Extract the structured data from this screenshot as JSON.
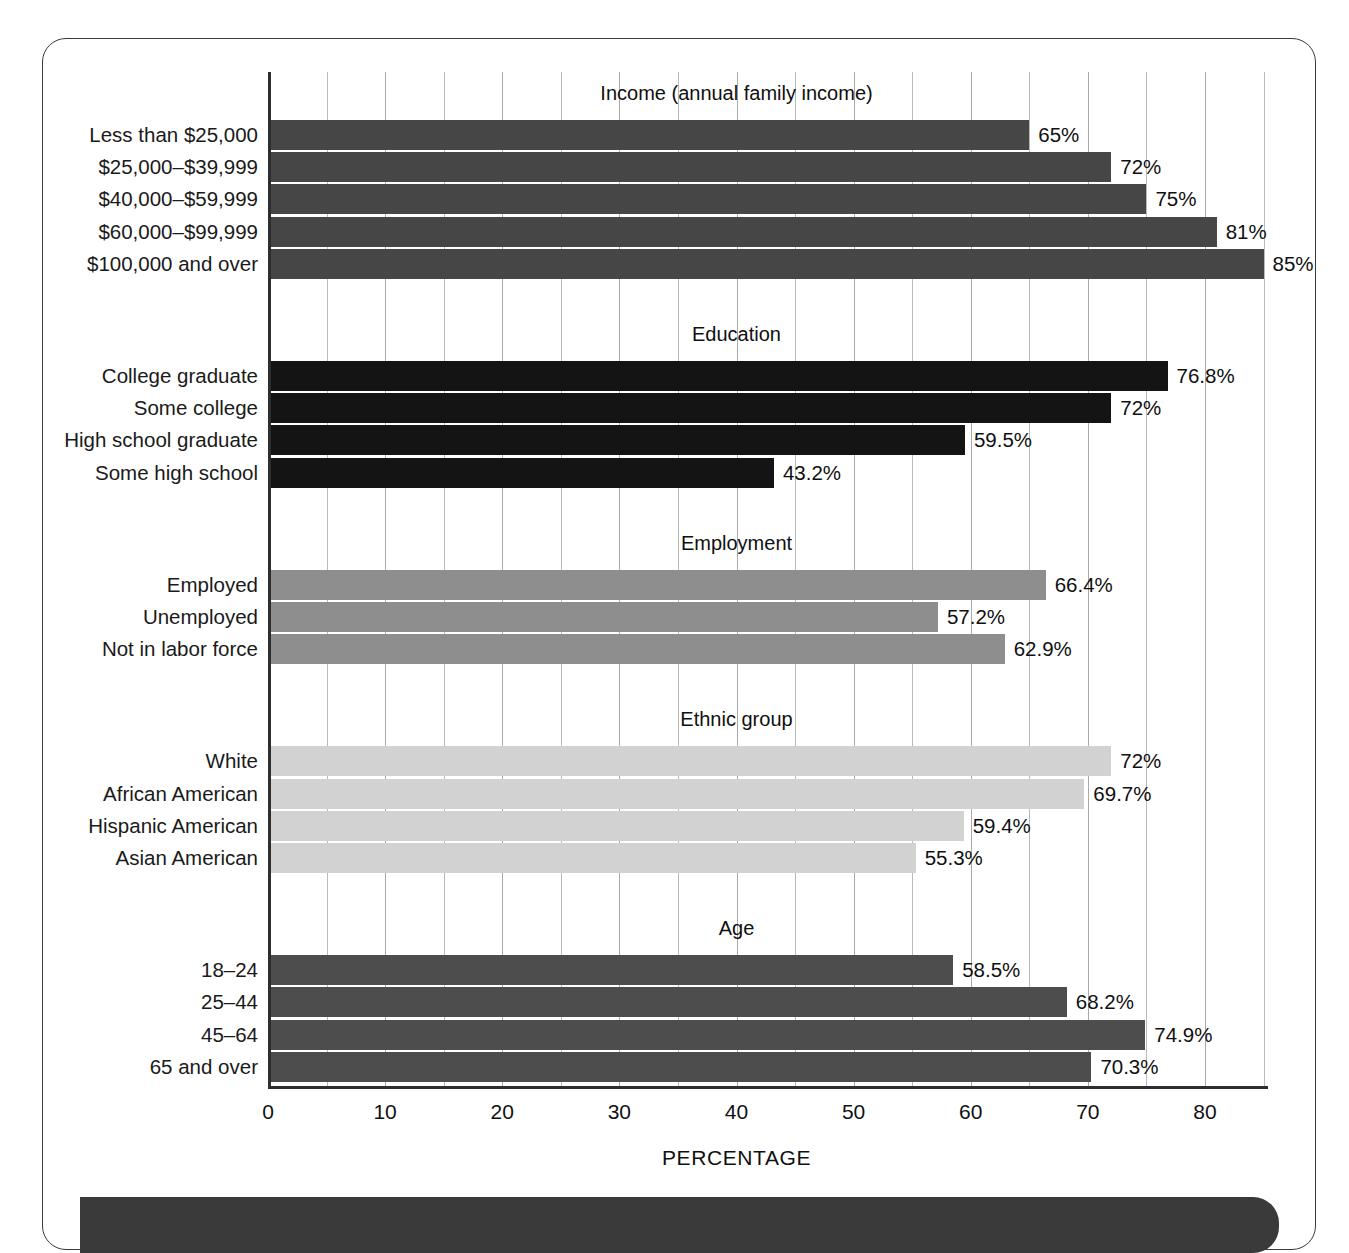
{
  "chart_data": {
    "type": "bar",
    "orientation": "horizontal",
    "title": "",
    "xlabel": "PERCENTAGE",
    "ylabel": "",
    "xlim": [
      0,
      86
    ],
    "xticks": [
      0,
      10,
      20,
      30,
      40,
      50,
      60,
      70,
      80
    ],
    "xtick_labels": [
      "0",
      "10",
      "20",
      "30",
      "40",
      "50",
      "60",
      "70",
      "80"
    ],
    "minor_gridline_step": 5,
    "grid": true,
    "legend": "none",
    "groups": [
      {
        "name": "income",
        "title": "Income (annual family income)",
        "color": "#464646",
        "categories": [
          "Less than $25,000",
          "$25,000–$39,999",
          "$40,000–$59,999",
          "$60,000–$99,999",
          "$100,000 and over"
        ],
        "values": [
          65,
          72,
          75,
          81,
          85
        ],
        "labels": [
          "65%",
          "72%",
          "75%",
          "81%",
          "85%"
        ]
      },
      {
        "name": "education",
        "title": "Education",
        "color": "#141414",
        "categories": [
          "College graduate",
          "Some college",
          "High school graduate",
          "Some high school"
        ],
        "values": [
          76.8,
          72,
          59.5,
          43.2
        ],
        "labels": [
          "76.8%",
          "72%",
          "59.5%",
          "43.2%"
        ]
      },
      {
        "name": "employment",
        "title": "Employment",
        "color": "#8e8e8e",
        "categories": [
          "Employed",
          "Unemployed",
          "Not in labor force"
        ],
        "values": [
          66.4,
          57.2,
          62.9
        ],
        "labels": [
          "66.4%",
          "57.2%",
          "62.9%"
        ]
      },
      {
        "name": "ethnic-group",
        "title": "Ethnic group",
        "color": "#d2d2d2",
        "categories": [
          "White",
          "African American",
          "Hispanic American",
          "Asian American"
        ],
        "values": [
          72,
          69.7,
          59.4,
          55.3
        ],
        "labels": [
          "72%",
          "69.7%",
          "59.4%",
          "55.3%"
        ]
      },
      {
        "name": "age",
        "title": "Age",
        "color": "#4d4d4d",
        "categories": [
          "18–24",
          "25–44",
          "45–64",
          "65 and over"
        ],
        "values": [
          58.5,
          68.2,
          74.9,
          70.3
        ],
        "labels": [
          "58.5%",
          "68.2%",
          "74.9%",
          "70.3%"
        ]
      }
    ]
  }
}
